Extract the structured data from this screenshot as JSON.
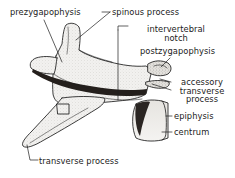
{
  "figure": {
    "background_color": "#ffffff",
    "ink_color": "#1c1c1c",
    "bone_fill_color": "#f0efed",
    "shadow_color": "#2a2724"
  },
  "labels": {
    "prezygapophysis": "prezygapophysis",
    "spinous_process": "spinous process",
    "intervertebral_notch_line1": "intervertebral",
    "intervertebral_notch_line2": "notch",
    "postzygapophysis": "postzygapophysis",
    "accessory_line1": "accessory",
    "accessory_line2": "transverse",
    "accessory_line3": "process",
    "epiphysis": "epiphysis",
    "centrum": "centrum",
    "transverse_process": "transverse process"
  }
}
